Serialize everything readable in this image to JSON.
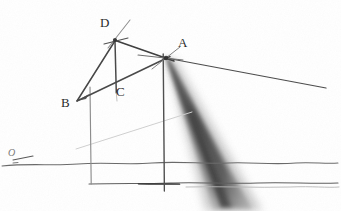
{
  "figure": {
    "medium": "pencil-on-paper",
    "background_color": "#ffffff",
    "pencil_color": "#4a4a4a",
    "dark_pencil_color": "#3a3a3a",
    "faint_pencil_color": "#c8c8c8",
    "shadow_color": "#5f5f5f",
    "width": 341,
    "height": 211
  },
  "labels": {
    "a": "A",
    "b": "B",
    "c": "C",
    "d": "D",
    "o": "O"
  },
  "label_positions": {
    "a": {
      "x": 178,
      "y": 38
    },
    "b": {
      "x": 62,
      "y": 98
    },
    "c": {
      "x": 115,
      "y": 85
    },
    "d": {
      "x": 100,
      "y": 17
    },
    "o": {
      "x": 8,
      "y": 150
    }
  },
  "points": {
    "a": {
      "x": 165,
      "y": 58
    },
    "b": {
      "x": 78,
      "y": 100
    },
    "c": {
      "x": 116,
      "y": 92
    },
    "d": {
      "x": 115,
      "y": 40
    },
    "o": {
      "x": 14,
      "y": 157
    }
  },
  "strokes": {
    "line_b_to_d": {
      "x1": 78,
      "y1": 100,
      "x2": 115,
      "y2": 40
    },
    "line_b_to_a": {
      "x1": 78,
      "y1": 100,
      "x2": 166,
      "y2": 57
    },
    "line_d_to_a": {
      "x1": 115,
      "y1": 40,
      "x2": 170,
      "y2": 60
    },
    "segment_d_to_c": {
      "x1": 115,
      "y1": 41,
      "x2": 116,
      "y2": 93
    },
    "ray_a_to_right": {
      "x1": 166,
      "y1": 58,
      "x2": 326,
      "y2": 88
    },
    "ray_d_overshoot": {
      "x1": 118,
      "y1": 46,
      "x2": 127,
      "y2": 21
    },
    "tick_at_a": {
      "x1": 139,
      "y1": 55,
      "x2": 181,
      "y2": 61
    },
    "tick_cross_a": {
      "x1": 152,
      "y1": 68,
      "x2": 179,
      "y2": 48
    },
    "vertical_left": {
      "x1": 90,
      "y1": 88,
      "x2": 91,
      "y2": 183
    },
    "vertical_main": {
      "x1": 163,
      "y1": 55,
      "x2": 164,
      "y2": 191
    },
    "ground_line_upper": {
      "y": 163,
      "x1": 0,
      "x2": 341
    },
    "ground_line_lower": {
      "y": 182,
      "x1": 90,
      "x2": 341
    },
    "o_tick_mark": {
      "x1": 14,
      "y1": 160,
      "x2": 32,
      "y2": 156
    },
    "faint_diagonal": {
      "x1": 76,
      "y1": 149,
      "x2": 192,
      "y2": 112
    },
    "thick_base_segment": {
      "x1": 140,
      "y1": 183,
      "x2": 178,
      "y2": 184
    }
  },
  "shadow_wedge": {
    "description": "dark tapered shadow band from point A descending to lower right",
    "apex": {
      "x": 166,
      "y": 58
    },
    "base_left": {
      "x": 213,
      "y": 211
    },
    "base_right": {
      "x": 252,
      "y": 211
    }
  },
  "accent_colors": {
    "paper": "#ffffff",
    "graphite": "#4a4a4a",
    "graphite_dark": "#333333",
    "graphite_light": "#b0b0b0",
    "shadow": "#6b6b6b"
  }
}
